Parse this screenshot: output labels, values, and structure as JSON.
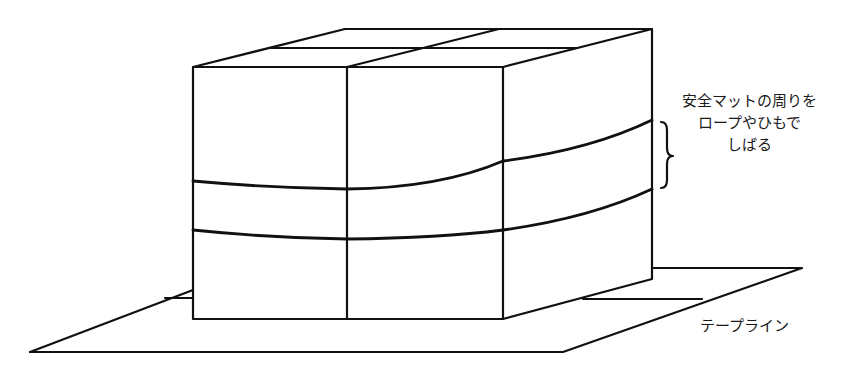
{
  "diagram": {
    "colors": {
      "line": "#111111",
      "background": "#ffffff"
    },
    "annotations": {
      "rope_note": {
        "lines": [
          "安全マットの周りを",
          "ロープやひもで",
          "しばる"
        ],
        "bracket": "right-curly-brace"
      },
      "tape_line": {
        "label": "テープライン"
      }
    },
    "elements": {
      "mat_stack": {
        "description": "積み重ねた安全マット（2×2ブロック）"
      },
      "ropes": {
        "count": 2
      },
      "floor_tape": {
        "description": "床のテープライン"
      }
    }
  }
}
